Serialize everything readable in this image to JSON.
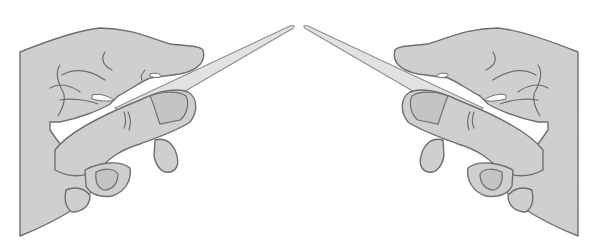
{
  "illustration": {
    "description": "Two hands facing each other, each holding a thin pointed blade (nail file) with tips meeting near the top center",
    "left_hand": {
      "label": "left-hand-holding-blade"
    },
    "right_hand": {
      "label": "right-hand-holding-blade"
    },
    "colors": {
      "background": "#ffffff",
      "skin_fill": "#cfcfcf",
      "outline": "#6f6f6f",
      "blade_fill": "#e2e2e2",
      "blade_outline": "#8e8e8e"
    }
  }
}
